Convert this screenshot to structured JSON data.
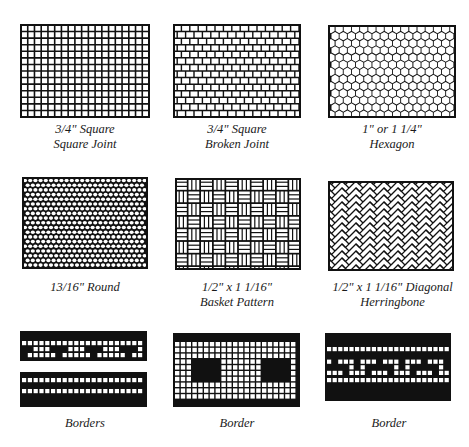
{
  "figure": {
    "ink_color": "#111111",
    "paper_color": "#ffffff",
    "panels": [
      {
        "id": "square-joint",
        "pattern": "square-grid",
        "caption": [
          "3/4\" Square",
          "Square Joint"
        ]
      },
      {
        "id": "broken-joint",
        "pattern": "brick",
        "caption": [
          "3/4\" Square",
          "Broken Joint"
        ]
      },
      {
        "id": "hexagon",
        "pattern": "hexagon",
        "caption": [
          "1\" or 1 1/4\"",
          "Hexagon"
        ]
      },
      {
        "id": "round",
        "pattern": "round",
        "caption": [
          "13/16\" Round"
        ]
      },
      {
        "id": "basket",
        "pattern": "basket",
        "caption": [
          "1/2\" x 1 1/16\"",
          "Basket Pattern"
        ]
      },
      {
        "id": "herringbone",
        "pattern": "herringbone",
        "caption": [
          "1/2\" x 1 1/16\" Diagonal",
          "Herringbone"
        ]
      },
      {
        "id": "borders",
        "pattern": "borders-double",
        "caption": [
          "Borders"
        ]
      },
      {
        "id": "border-squares",
        "pattern": "border-squares",
        "caption": [
          "Border"
        ]
      },
      {
        "id": "border-greek",
        "pattern": "border-greek",
        "caption": [
          "Border"
        ]
      }
    ]
  }
}
